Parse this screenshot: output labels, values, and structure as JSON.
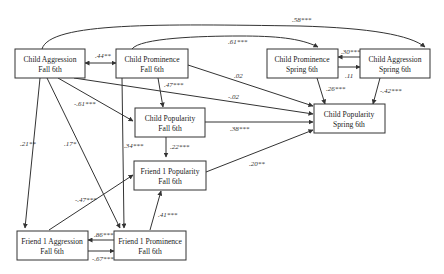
{
  "diagram": {
    "type": "path-model",
    "nodes": [
      {
        "id": "ca_f",
        "line1": "Child Aggression",
        "line2": "Fall 6th"
      },
      {
        "id": "cpr_f",
        "line1": "Child Prominence",
        "line2": "Fall 6th"
      },
      {
        "id": "cpr_s",
        "line1": "Child Prominence",
        "line2": "Spring 6th"
      },
      {
        "id": "ca_s",
        "line1": "Child Aggression",
        "line2": "Spring 6th"
      },
      {
        "id": "cpop_f",
        "line1": "Child Popularity",
        "line2": "Fall 6th"
      },
      {
        "id": "cpop_s",
        "line1": "Child Popularity",
        "line2": "Spring 6th"
      },
      {
        "id": "f1pop_f",
        "line1": "Friend 1 Popularity",
        "line2": "Fall 6th"
      },
      {
        "id": "f1a_f",
        "line1": "Friend 1 Aggression",
        "line2": "Fall 6th"
      },
      {
        "id": "f1pr_f",
        "line1": "Friend 1 Prominence",
        "line2": "Fall 6th"
      }
    ],
    "edges": [
      {
        "from": "ca_f",
        "to": "ca_s",
        "label": ".58***"
      },
      {
        "from": "cpr_f",
        "to": "cpr_s",
        "label": ".61***"
      },
      {
        "from": "ca_f",
        "to": "cpr_f",
        "label": ".44**",
        "bidirectional": true
      },
      {
        "from": "ca_s",
        "to": "cpr_s",
        "label": ".30***"
      },
      {
        "from": "cpr_s",
        "to": "ca_s",
        "label": ".11"
      },
      {
        "from": "cpr_f",
        "to": "cpop_s",
        "label": ".02"
      },
      {
        "from": "ca_f",
        "to": "cpop_s",
        "label": "-.02"
      },
      {
        "from": "cpr_f",
        "to": "cpop_f",
        "label": ".47***"
      },
      {
        "from": "ca_f",
        "to": "cpop_f",
        "label": "-.61***"
      },
      {
        "from": "cpr_s",
        "to": "cpop_s",
        "label": ".26***"
      },
      {
        "from": "ca_s",
        "to": "cpop_s",
        "label": "-.42***"
      },
      {
        "from": "cpop_f",
        "to": "cpop_s",
        "label": ".38***"
      },
      {
        "from": "cpop_f",
        "to": "f1pop_f",
        "label": ".22***"
      },
      {
        "from": "f1pop_f",
        "to": "cpop_s",
        "label": ".20**"
      },
      {
        "from": "ca_f",
        "to": "f1a_f",
        "label": ".21**"
      },
      {
        "from": "ca_f",
        "to": "f1pr_f",
        "label": ".17*"
      },
      {
        "from": "cpr_f",
        "to": "f1pr_f",
        "label": ".34***"
      },
      {
        "from": "f1a_f",
        "to": "f1pop_f",
        "label": "-.47***"
      },
      {
        "from": "f1pr_f",
        "to": "f1pop_f",
        "label": ".41***"
      },
      {
        "from": "f1pr_f",
        "to": "f1a_f",
        "label": ".86***"
      },
      {
        "from": "f1a_f",
        "to": "f1pr_f",
        "label": "-.67***"
      }
    ]
  }
}
